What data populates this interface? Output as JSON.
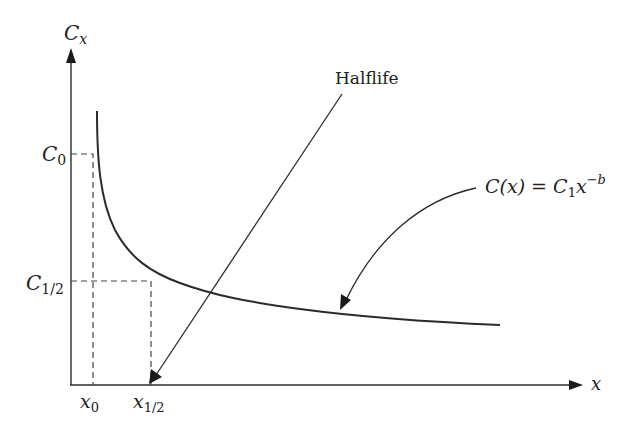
{
  "diagram": {
    "title": "",
    "y_axis": {
      "label": "C",
      "label_sub": "x"
    },
    "x_axis": {
      "label": "x"
    },
    "y_ticks": [
      {
        "label": "C",
        "sub": "0"
      },
      {
        "label": "C",
        "sub": "1/2"
      }
    ],
    "x_ticks": [
      {
        "label": "x",
        "sub": "0"
      },
      {
        "label": "x",
        "sub": "1/2"
      }
    ],
    "annotations": {
      "halflife": "Halflife",
      "formula_lhs": "C(x) = C",
      "formula_sub": "1",
      "formula_x": "x",
      "formula_exp": "−b"
    },
    "colors": {
      "line": "#2b2b2b",
      "dash": "#444444",
      "text": "#222222"
    }
  }
}
